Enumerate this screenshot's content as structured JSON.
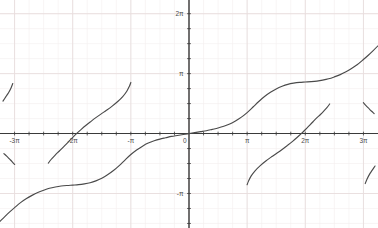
{
  "chart_data": {
    "type": "line",
    "title": "",
    "subtitle": "",
    "xlabel": "",
    "ylabel": "",
    "xlim": [
      -10.21,
      10.21
    ],
    "ylim": [
      -4.95,
      7.0
    ],
    "grid": true,
    "grid_major_color": "#e8dede",
    "grid_minor_color": "#f3eeee",
    "axis_color": "#3a3a3a",
    "curve_color": "#4a4a4a",
    "legend": null,
    "legend_position": "none",
    "xticks": [
      {
        "value": -9.4248,
        "label": "-3π"
      },
      {
        "value": -6.2832,
        "label": "-2π"
      },
      {
        "value": -3.1416,
        "label": "-π"
      },
      {
        "value": 0.0,
        "label": "0"
      },
      {
        "value": 3.1416,
        "label": "π"
      },
      {
        "value": 6.2832,
        "label": "2π"
      },
      {
        "value": 9.4248,
        "label": "3π"
      }
    ],
    "yticks": [
      {
        "value": -3.1416,
        "label": "-π"
      },
      {
        "value": 3.1416,
        "label": "π"
      },
      {
        "value": 6.2832,
        "label": "2π"
      }
    ],
    "minor_tick_spacing_x": 0.7854,
    "minor_tick_spacing_y": 0.7854,
    "series": [
      {
        "name": "principal-branch",
        "description": "central S-shaped branch through the origin, odd symmetric, spanning x from -3pi-ish to 3pi-ish",
        "points": [
          [
            -10.21,
            -4.6
          ],
          [
            -9.95,
            -4.35
          ],
          [
            -9.7,
            -4.12
          ],
          [
            -9.42,
            -3.88
          ],
          [
            -9.1,
            -3.62
          ],
          [
            -8.8,
            -3.42
          ],
          [
            -8.48,
            -3.24
          ],
          [
            -8.17,
            -3.09
          ],
          [
            -7.85,
            -2.97
          ],
          [
            -7.54,
            -2.87
          ],
          [
            -7.22,
            -2.8
          ],
          [
            -6.91,
            -2.75
          ],
          [
            -6.6,
            -2.72
          ],
          [
            -6.28,
            -2.7
          ],
          [
            -5.97,
            -2.68
          ],
          [
            -5.65,
            -2.64
          ],
          [
            -5.34,
            -2.58
          ],
          [
            -5.03,
            -2.48
          ],
          [
            -4.71,
            -2.34
          ],
          [
            -4.4,
            -2.16
          ],
          [
            -4.08,
            -1.94
          ],
          [
            -3.77,
            -1.68
          ],
          [
            -3.46,
            -1.39
          ],
          [
            -3.14,
            -1.1
          ],
          [
            -2.83,
            -0.86
          ],
          [
            -2.51,
            -0.66
          ],
          [
            -2.2,
            -0.5
          ],
          [
            -1.88,
            -0.38
          ],
          [
            -1.57,
            -0.29
          ],
          [
            -1.26,
            -0.22
          ],
          [
            -0.94,
            -0.15
          ],
          [
            -0.63,
            -0.1
          ],
          [
            -0.31,
            -0.05
          ],
          [
            0.0,
            0.0
          ],
          [
            0.31,
            0.05
          ],
          [
            0.63,
            0.1
          ],
          [
            0.94,
            0.15
          ],
          [
            1.26,
            0.22
          ],
          [
            1.57,
            0.29
          ],
          [
            1.88,
            0.38
          ],
          [
            2.2,
            0.5
          ],
          [
            2.51,
            0.66
          ],
          [
            2.83,
            0.86
          ],
          [
            3.14,
            1.1
          ],
          [
            3.46,
            1.39
          ],
          [
            3.77,
            1.68
          ],
          [
            4.08,
            1.94
          ],
          [
            4.4,
            2.16
          ],
          [
            4.71,
            2.34
          ],
          [
            5.03,
            2.48
          ],
          [
            5.34,
            2.58
          ],
          [
            5.65,
            2.64
          ],
          [
            5.97,
            2.68
          ],
          [
            6.28,
            2.7
          ],
          [
            6.6,
            2.72
          ],
          [
            6.91,
            2.75
          ],
          [
            7.22,
            2.8
          ],
          [
            7.54,
            2.87
          ],
          [
            7.85,
            2.97
          ],
          [
            8.17,
            3.09
          ],
          [
            8.48,
            3.24
          ],
          [
            8.8,
            3.42
          ],
          [
            9.1,
            3.62
          ],
          [
            9.42,
            3.88
          ],
          [
            9.7,
            4.12
          ],
          [
            9.95,
            4.35
          ],
          [
            10.21,
            4.6
          ]
        ]
      },
      {
        "name": "upper-branch-left",
        "description": "branch rising steeply just left of x = -pi, crossing zero near x = -2pi",
        "points": [
          [
            -7.6,
            -1.55
          ],
          [
            -7.45,
            -1.36
          ],
          [
            -7.28,
            -1.18
          ],
          [
            -7.1,
            -1.0
          ],
          [
            -6.9,
            -0.82
          ],
          [
            -6.7,
            -0.62
          ],
          [
            -6.5,
            -0.42
          ],
          [
            -6.28,
            -0.2
          ],
          [
            -6.05,
            0.02
          ],
          [
            -5.82,
            0.22
          ],
          [
            -5.58,
            0.42
          ],
          [
            -5.32,
            0.62
          ],
          [
            -5.05,
            0.82
          ],
          [
            -4.76,
            1.02
          ],
          [
            -4.46,
            1.22
          ],
          [
            -4.15,
            1.44
          ],
          [
            -3.85,
            1.68
          ],
          [
            -3.58,
            1.94
          ],
          [
            -3.36,
            2.22
          ],
          [
            -3.22,
            2.48
          ],
          [
            -3.14,
            2.68
          ]
        ]
      },
      {
        "name": "lower-branch-right",
        "description": "branch rising from just right of x = pi, crossing zero near x = 2pi",
        "points": [
          [
            3.14,
            -2.68
          ],
          [
            3.22,
            -2.48
          ],
          [
            3.36,
            -2.22
          ],
          [
            3.58,
            -1.94
          ],
          [
            3.85,
            -1.68
          ],
          [
            4.15,
            -1.44
          ],
          [
            4.46,
            -1.22
          ],
          [
            4.76,
            -1.02
          ],
          [
            5.05,
            -0.82
          ],
          [
            5.32,
            -0.62
          ],
          [
            5.58,
            -0.42
          ],
          [
            5.82,
            -0.22
          ],
          [
            6.05,
            -0.02
          ],
          [
            6.28,
            0.2
          ],
          [
            6.5,
            0.42
          ],
          [
            6.7,
            0.62
          ],
          [
            6.9,
            0.82
          ],
          [
            7.1,
            1.0
          ],
          [
            7.28,
            1.18
          ],
          [
            7.45,
            1.36
          ],
          [
            7.6,
            1.55
          ]
        ]
      },
      {
        "name": "far-upper-left-stub",
        "description": "short high-slope segment in the upper-left corner beyond x = -3pi",
        "points": [
          [
            -10.05,
            1.7
          ],
          [
            -9.9,
            1.92
          ],
          [
            -9.75,
            2.14
          ],
          [
            -9.62,
            2.38
          ],
          [
            -9.52,
            2.62
          ]
        ]
      },
      {
        "name": "far-lower-right-stub",
        "description": "short high-slope segment in the lower-right corner beyond x = 3pi",
        "points": [
          [
            9.52,
            -2.62
          ],
          [
            9.62,
            -2.38
          ],
          [
            9.75,
            -2.14
          ],
          [
            9.9,
            -1.92
          ],
          [
            10.05,
            -1.7
          ]
        ]
      },
      {
        "name": "lower-left-short-branch",
        "description": "short segment descending left of x = -3pi toward lower-left",
        "points": [
          [
            -9.42,
            -1.62
          ],
          [
            -9.55,
            -1.48
          ],
          [
            -9.7,
            -1.33
          ],
          [
            -9.85,
            -1.18
          ],
          [
            -10.0,
            -1.05
          ]
        ]
      },
      {
        "name": "upper-right-short-branch",
        "description": "short segment ascending right of x = 3pi toward upper-right",
        "points": [
          [
            9.42,
            1.62
          ],
          [
            9.55,
            1.48
          ],
          [
            9.7,
            1.33
          ],
          [
            9.85,
            1.18
          ],
          [
            10.0,
            1.05
          ]
        ]
      }
    ]
  },
  "axes": {
    "x_axis_name": "horizontal-axis",
    "y_axis_name": "vertical-axis",
    "origin_label": "0"
  }
}
